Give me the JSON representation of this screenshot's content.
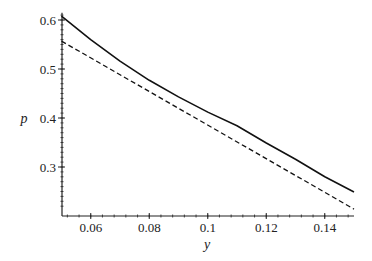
{
  "chart_data": {
    "type": "line",
    "title": "",
    "xlabel": "y",
    "ylabel": "p",
    "xlim": [
      0.05,
      0.15
    ],
    "ylim": [
      0.21,
      0.615
    ],
    "x_ticks": [
      "0.06",
      "0.08",
      "0.1",
      "0.12",
      "0.14"
    ],
    "y_ticks": [
      "0.3",
      "0.4",
      "0.5",
      "0.6"
    ],
    "grid": false,
    "legend": null,
    "series": [
      {
        "name": "solid curve",
        "style": "solid",
        "x": [
          0.05,
          0.06,
          0.07,
          0.08,
          0.09,
          0.1,
          0.11,
          0.12,
          0.13,
          0.14,
          0.15
        ],
        "values": [
          0.608,
          0.56,
          0.516,
          0.477,
          0.443,
          0.412,
          0.384,
          0.349,
          0.316,
          0.28,
          0.249
        ]
      },
      {
        "name": "dashed tangent line",
        "style": "dashed",
        "x": [
          0.05,
          0.15
        ],
        "values": [
          0.557,
          0.214
        ]
      }
    ]
  }
}
